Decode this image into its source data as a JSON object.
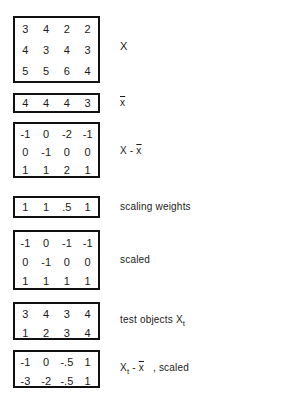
{
  "matrices": [
    {
      "id": "X",
      "rows": [
        [
          "3",
          "4",
          "2",
          "2"
        ],
        [
          "4",
          "3",
          "4",
          "3"
        ],
        [
          "5",
          "5",
          "6",
          "4"
        ]
      ],
      "label": "X"
    },
    {
      "id": "xbar",
      "rows": [
        [
          "4",
          "4",
          "4",
          "3"
        ]
      ],
      "label": "x"
    },
    {
      "id": "X_minus_xbar",
      "rows": [
        [
          "-1",
          "0",
          "-2",
          "-1"
        ],
        [
          "0",
          "-1",
          "0",
          "0"
        ],
        [
          "1",
          "1",
          "2",
          "1"
        ]
      ],
      "label_pre": "X - ",
      "label_ovl": "x"
    },
    {
      "id": "weights",
      "rows": [
        [
          "1",
          "1",
          ".5",
          "1"
        ]
      ],
      "label": "scaling weights"
    },
    {
      "id": "scaled",
      "rows": [
        [
          "-1",
          "0",
          "-1",
          "-1"
        ],
        [
          "0",
          "-1",
          "0",
          "0"
        ],
        [
          "1",
          "1",
          "1",
          "1"
        ]
      ],
      "label": "scaled"
    },
    {
      "id": "test_objects",
      "rows": [
        [
          "3",
          "4",
          "3",
          "4"
        ],
        [
          "1",
          "2",
          "3",
          "4"
        ]
      ],
      "label": "test objects X",
      "label_sub": "t"
    },
    {
      "id": "test_scaled",
      "rows": [
        [
          "-1",
          "0",
          "-.5",
          "1"
        ],
        [
          "-3",
          "-2",
          "-.5",
          "1"
        ]
      ],
      "label_pre": "X",
      "label_sub": "t",
      "label_mid": " - ",
      "label_ovl": "x",
      "label_post": "   , scaled"
    }
  ]
}
